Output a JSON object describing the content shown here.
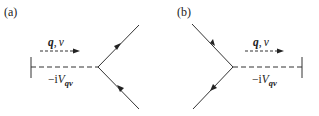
{
  "panels": [
    {
      "label": "(a)",
      "momentum_label": {
        "q": "q",
        "sep": ",",
        "nu": "ν"
      },
      "vertex_label": {
        "prefix": "−i",
        "V": "V",
        "sub": "qν"
      }
    },
    {
      "label": "(b)",
      "momentum_label": {
        "q": "q",
        "sep": ",",
        "nu": "ν"
      },
      "vertex_label": {
        "prefix": "−i",
        "V": "V",
        "sub": "qν"
      }
    }
  ],
  "colors": {
    "line": "#333333",
    "text": "#222222",
    "background": "#ffffff"
  }
}
